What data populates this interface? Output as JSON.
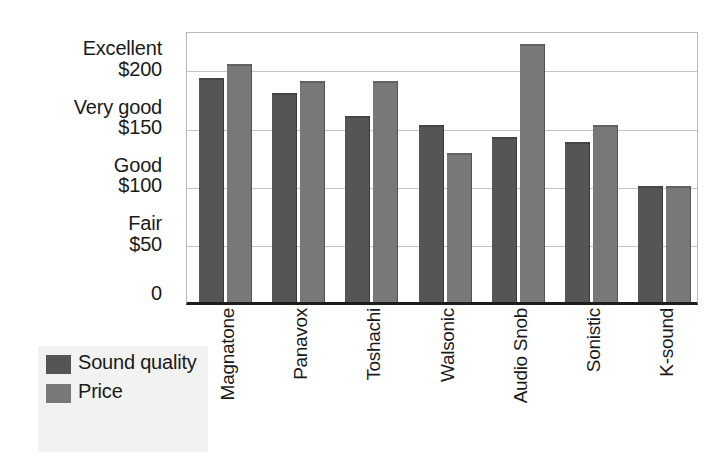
{
  "chart_data": {
    "type": "bar",
    "title": "",
    "subtitle": "",
    "xlabel": "",
    "ylabel": "",
    "grid": true,
    "legend_position": "bottom-left",
    "ylim": [
      0,
      233
    ],
    "categories": [
      "Magnatone",
      "Panavox",
      "Toshachi",
      "Walsonic",
      "Audio Snob",
      "Sonistic",
      "K-sound"
    ],
    "series": [
      {
        "name": "Sound quality",
        "color": "#555555",
        "values": [
          193,
          180,
          160,
          152,
          142,
          138,
          100
        ]
      },
      {
        "name": "Price",
        "color": "#787878",
        "values": [
          205,
          190,
          190,
          128,
          222,
          152,
          100
        ]
      }
    ],
    "y_ticks": [
      {
        "value": 200,
        "quality": "Excellent",
        "money": "$200"
      },
      {
        "value": 150,
        "quality": "Very good",
        "money": "$150"
      },
      {
        "value": 100,
        "quality": "Good",
        "money": "$100"
      },
      {
        "value": 50,
        "quality": "Fair",
        "money": "$50"
      },
      {
        "value": 0,
        "quality": "",
        "money": "0"
      }
    ],
    "annotations": []
  },
  "legend": {
    "items": [
      {
        "label": "Sound quality",
        "color": "#555555"
      },
      {
        "label": "Price",
        "color": "#787878"
      }
    ]
  },
  "colors": {
    "sound_quality": "#555555",
    "price": "#787878",
    "gridline": "#c4c4c4",
    "axis": "#1d1d1d",
    "legend_background": "#f2f2f0",
    "plot_background": "#ffffff"
  }
}
